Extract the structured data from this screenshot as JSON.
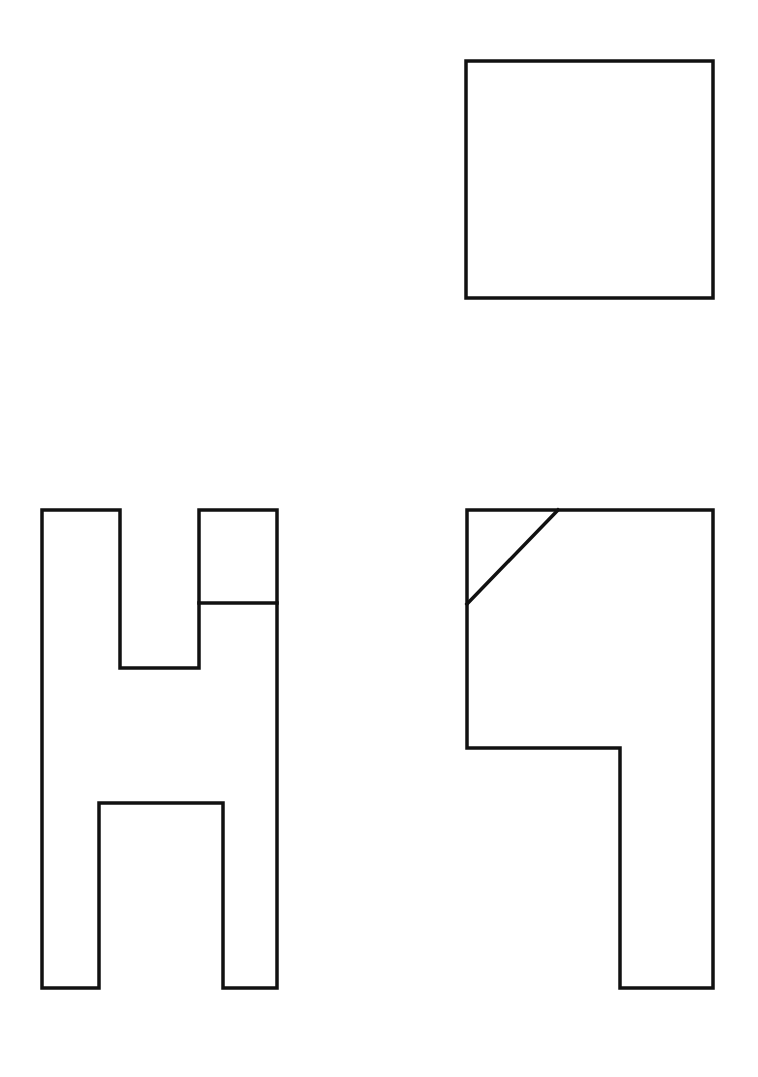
{
  "diagram": {
    "type": "orthographic-projection",
    "views": [
      {
        "name": "top-view",
        "shape": "square",
        "points": [
          [
            466,
            61
          ],
          [
            713,
            61
          ],
          [
            713,
            298
          ],
          [
            466,
            298
          ]
        ]
      },
      {
        "name": "front-view",
        "shape": "outline",
        "points": [
          [
            42,
            510
          ],
          [
            120,
            510
          ],
          [
            120,
            668
          ],
          [
            199,
            668
          ],
          [
            199,
            510
          ],
          [
            277,
            510
          ],
          [
            277,
            988
          ],
          [
            223,
            988
          ],
          [
            223,
            803
          ],
          [
            99,
            803
          ],
          [
            99,
            988
          ],
          [
            42,
            988
          ]
        ],
        "internal_lines": [
          [
            [
              199,
              603
            ],
            [
              277,
              603
            ]
          ]
        ]
      },
      {
        "name": "side-view",
        "shape": "outline",
        "points": [
          [
            467,
            510
          ],
          [
            713,
            510
          ],
          [
            713,
            988
          ],
          [
            620,
            988
          ],
          [
            620,
            748
          ],
          [
            467,
            748
          ]
        ],
        "internal_lines": [
          [
            [
              558,
              510
            ],
            [
              467,
              604
            ]
          ]
        ]
      }
    ],
    "colors": {
      "line": "#111111",
      "background": "#ffffff"
    }
  }
}
